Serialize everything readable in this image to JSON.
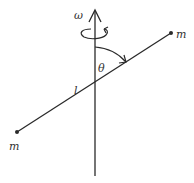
{
  "diagram": {
    "type": "physics-rotating-rod",
    "labels": {
      "omega": "ω",
      "theta": "θ",
      "length": "l",
      "mass_top": "m",
      "mass_bottom": "m"
    },
    "colors": {
      "line": "#2a2a2a",
      "background": "#ffffff"
    }
  }
}
